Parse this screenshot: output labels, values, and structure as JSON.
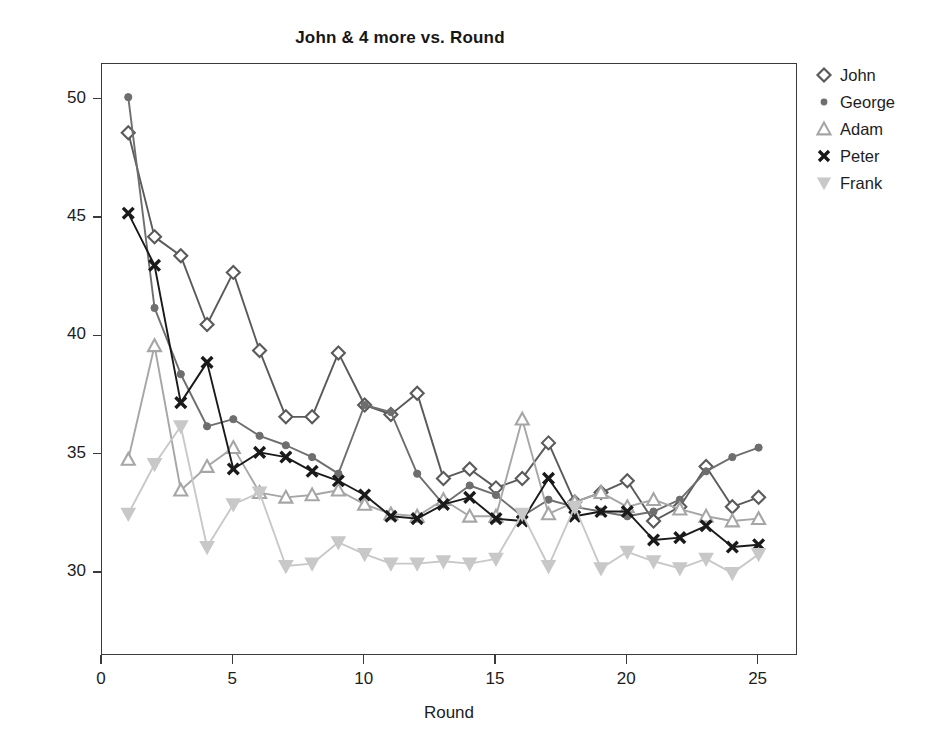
{
  "chart_data": {
    "type": "line",
    "title": "John & 4 more vs. Round",
    "xlabel": "Round",
    "ylabel": "Lap times",
    "xlim": [
      0,
      26.5
    ],
    "ylim": [
      26.5,
      51.5
    ],
    "xticks": [
      0,
      5,
      10,
      15,
      20,
      25
    ],
    "yticks": [
      30,
      35,
      40,
      45,
      50
    ],
    "grid": false,
    "legend_position": "right-outside",
    "x": [
      1,
      2,
      3,
      4,
      5,
      6,
      7,
      8,
      9,
      10,
      11,
      12,
      13,
      14,
      15,
      16,
      17,
      18,
      19,
      20,
      21,
      22,
      23,
      24,
      25
    ],
    "series": [
      {
        "name": "John",
        "marker": "diamond",
        "color": "#5a5a5a",
        "values": [
          48.6,
          44.2,
          43.4,
          40.5,
          42.7,
          39.4,
          36.6,
          36.6,
          39.3,
          37.1,
          36.7,
          37.6,
          34.0,
          34.4,
          33.6,
          34.0,
          35.5,
          33.0,
          33.4,
          33.9,
          32.2,
          32.8,
          34.5,
          32.8,
          33.2
        ]
      },
      {
        "name": "George",
        "marker": "circle",
        "color": "#6e6e6e",
        "values": [
          50.1,
          41.2,
          38.4,
          36.2,
          36.5,
          35.8,
          35.4,
          34.9,
          34.2,
          37.1,
          36.8,
          34.2,
          32.9,
          33.7,
          33.3,
          32.4,
          33.1,
          32.8,
          32.6,
          32.4,
          32.6,
          33.1,
          34.3,
          34.9,
          35.3
        ]
      },
      {
        "name": "Adam",
        "marker": "triangle-up",
        "color": "#a6a6a6",
        "values": [
          34.8,
          39.6,
          33.5,
          34.5,
          35.3,
          33.4,
          33.2,
          33.3,
          33.5,
          32.9,
          32.5,
          32.4,
          33.1,
          32.4,
          32.4,
          36.5,
          32.5,
          33.0,
          33.4,
          32.8,
          33.1,
          32.7,
          32.4,
          32.2,
          32.3
        ]
      },
      {
        "name": "Peter",
        "marker": "x",
        "color": "#1a1a1a",
        "values": [
          45.2,
          43.0,
          37.2,
          38.9,
          34.4,
          35.1,
          34.9,
          34.3,
          33.9,
          33.3,
          32.4,
          32.3,
          32.9,
          33.2,
          32.3,
          32.2,
          34.0,
          32.4,
          32.6,
          32.6,
          31.4,
          31.5,
          32.0,
          31.1,
          31.2
        ]
      },
      {
        "name": "Frank",
        "marker": "triangle-down",
        "color": "#c8c8c8",
        "values": [
          32.5,
          34.6,
          36.2,
          31.1,
          32.9,
          33.4,
          30.3,
          30.4,
          31.3,
          30.8,
          30.4,
          30.4,
          30.5,
          30.4,
          30.6,
          32.5,
          30.3,
          32.8,
          30.2,
          30.9,
          30.5,
          30.2,
          30.6,
          30.0,
          30.8
        ]
      }
    ]
  },
  "axes": {
    "ytick_labels": [
      "50",
      "45",
      "40",
      "35",
      "30"
    ],
    "xtick_labels": [
      "0",
      "5",
      "10",
      "15",
      "20",
      "25"
    ]
  },
  "legend": {
    "items": [
      {
        "label": "John",
        "marker": "diamond-icon"
      },
      {
        "label": "George",
        "marker": "circle-icon"
      },
      {
        "label": "Adam",
        "marker": "triangle-up-icon"
      },
      {
        "label": "Peter",
        "marker": "x-icon"
      },
      {
        "label": "Frank",
        "marker": "triangle-down-icon"
      }
    ]
  }
}
